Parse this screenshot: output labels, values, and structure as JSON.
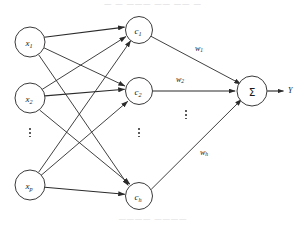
{
  "figure": {
    "title_fragment": "—  —  ———  ——  ——  —",
    "caption_fragment": "————      ————",
    "background_color": "#ffffff",
    "stroke_color": "#2b2b2b"
  },
  "diagram": {
    "type": "neural-network",
    "layers": {
      "input": {
        "name": "input-layer",
        "nodes": [
          {
            "id": "x1",
            "base": "x",
            "sub": "1",
            "cx": 30,
            "cy": 42,
            "r": 15
          },
          {
            "id": "x2",
            "base": "x",
            "sub": "2",
            "cx": 30,
            "cy": 98,
            "r": 15
          },
          {
            "id": "xp",
            "base": "x",
            "sub": "p",
            "cx": 30,
            "cy": 185,
            "r": 15
          }
        ],
        "ellipsis": {
          "x": 30,
          "y": 132
        }
      },
      "hidden": {
        "name": "hidden-layer",
        "nodes": [
          {
            "id": "c1",
            "base": "c",
            "sub": "1",
            "cx": 139,
            "cy": 30,
            "r": 13.5
          },
          {
            "id": "c2",
            "base": "c",
            "sub": "2",
            "cx": 139,
            "cy": 91,
            "r": 13.5
          },
          {
            "id": "ch",
            "base": "c",
            "sub": "h",
            "cx": 139,
            "cy": 196,
            "r": 13.5
          }
        ],
        "ellipsis": {
          "x": 139,
          "y": 132
        }
      },
      "output": {
        "name": "output-layer",
        "node": {
          "id": "sigma",
          "symbol": "Σ",
          "cx": 252,
          "cy": 91,
          "r": 15
        },
        "result_label": "Y",
        "result_label_x": 288,
        "result_label_y": 91
      }
    },
    "weights": [
      {
        "id": "w1",
        "base": "w",
        "sub": "1",
        "x": 199,
        "y": 48
      },
      {
        "id": "w2",
        "base": "w",
        "sub": "2",
        "x": 180,
        "y": 79
      },
      {
        "id": "wh",
        "base": "w",
        "sub": "h",
        "x": 204,
        "y": 152
      }
    ],
    "weights_ellipsis": {
      "x": 186,
      "y": 114
    },
    "edges_input_hidden": [
      {
        "from": "x1",
        "to": "c1"
      },
      {
        "from": "x1",
        "to": "c2"
      },
      {
        "from": "x1",
        "to": "ch"
      },
      {
        "from": "x2",
        "to": "c1"
      },
      {
        "from": "x2",
        "to": "c2"
      },
      {
        "from": "x2",
        "to": "ch"
      },
      {
        "from": "xp",
        "to": "c1"
      },
      {
        "from": "xp",
        "to": "c2"
      },
      {
        "from": "xp",
        "to": "ch"
      }
    ],
    "edges_hidden_output": [
      {
        "from": "c1",
        "to": "sigma",
        "weight": "w1"
      },
      {
        "from": "c2",
        "to": "sigma",
        "weight": "w2"
      },
      {
        "from": "ch",
        "to": "sigma",
        "weight": "wh"
      }
    ]
  }
}
